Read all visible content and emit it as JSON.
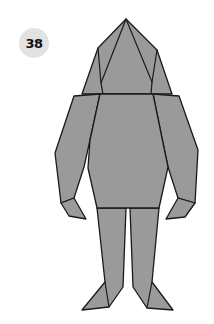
{
  "step": {
    "number": "38",
    "badge_color": "#e2e2e2"
  },
  "figure": {
    "paper_color": "#9a9a9a",
    "line_color": "#1a1a1a",
    "parts": [
      "head",
      "left-arm",
      "right-arm",
      "body",
      "left-leg",
      "right-leg",
      "left-hand",
      "right-hand",
      "left-foot",
      "right-foot"
    ]
  }
}
